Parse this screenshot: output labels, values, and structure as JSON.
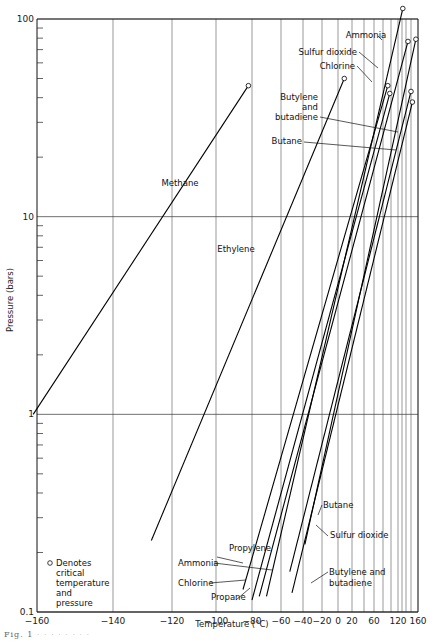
{
  "chart_data": {
    "type": "line",
    "title": "",
    "xlabel": "Temperature (°C)",
    "ylabel": "Pressure (bars)",
    "yscale": "log",
    "ylim": [
      0.1,
      100
    ],
    "xlim": [
      -160,
      160
    ],
    "grid": true,
    "x_ticks": [
      -160,
      -140,
      -120,
      -100,
      -80,
      -60,
      -40,
      -20,
      0,
      20,
      60,
      120,
      160
    ],
    "x_tick_labels": [
      "−160",
      "−140",
      "−120",
      "−100",
      "−80",
      "−60",
      "−40",
      "−20",
      "0",
      "20",
      "60",
      "120",
      "160"
    ],
    "x_gridlines": [
      -140,
      -120,
      -100,
      -80,
      -60,
      -40,
      -20,
      0,
      20,
      40,
      60,
      80,
      100,
      120,
      130,
      140,
      150,
      160
    ],
    "y_major_ticks": [
      0.1,
      1,
      10,
      100
    ],
    "y_tick_labels": [
      "0.1",
      "1",
      "10",
      "100"
    ],
    "legend": {
      "symbol": "o",
      "text": [
        "Denotes",
        "critical",
        "temperature",
        "and",
        "pressure"
      ],
      "placement": "bottom-left"
    },
    "series": [
      {
        "name": "Methane",
        "points": [
          [
            -161,
            1.0
          ],
          [
            -82,
            46
          ]
        ],
        "critical_point": [
          -82,
          46
        ]
      },
      {
        "name": "Ethylene",
        "points": [
          [
            -127,
            0.23
          ],
          [
            9,
            50
          ]
        ],
        "critical_point": [
          9,
          50
        ]
      },
      {
        "name": "Propylene",
        "points": [
          [
            -85,
            0.13
          ],
          [
            92,
            46
          ]
        ],
        "critical_point": [
          92,
          46
        ]
      },
      {
        "name": "Ammonia",
        "points": [
          [
            -70,
            0.12
          ],
          [
            132,
            113
          ]
        ],
        "critical_point": [
          132,
          113
        ]
      },
      {
        "name": "Chlorine",
        "points": [
          [
            -75,
            0.12
          ],
          [
            144,
            77
          ]
        ],
        "critical_point": [
          144,
          77
        ]
      },
      {
        "name": "Propane",
        "points": [
          [
            -80,
            0.115
          ],
          [
            97,
            42
          ]
        ],
        "critical_point": [
          97,
          42
        ]
      },
      {
        "name": "Sulfur dioxide",
        "points": [
          [
            -38,
            0.22
          ],
          [
            157,
            79
          ]
        ],
        "critical_point": [
          157,
          79
        ]
      },
      {
        "name": "Butane",
        "points": [
          [
            -50,
            0.125
          ],
          [
            152,
            38
          ]
        ],
        "critical_point": [
          152,
          38
        ]
      },
      {
        "name": "Butylene and butadiene",
        "points": [
          [
            -52,
            0.16
          ],
          [
            150,
            43
          ]
        ],
        "critical_point": [
          150,
          43
        ]
      }
    ],
    "annotations": [
      {
        "text": "Methane",
        "target": "Methane"
      },
      {
        "text": "Ethylene",
        "target": "Ethylene"
      },
      {
        "text": "Ammonia",
        "target": "Ammonia",
        "position": "top"
      },
      {
        "text": "Sulfur dioxide",
        "target": "Sulfur dioxide",
        "position": "top"
      },
      {
        "text": "Chlorine",
        "target": "Chlorine",
        "position": "top"
      },
      {
        "text": "Butylene and butadiene",
        "target": "Butylene and butadiene",
        "position": "top"
      },
      {
        "text": "Butane",
        "target": "Butane",
        "position": "top"
      },
      {
        "text": "Propylene",
        "target": "Propylene",
        "position": "bottom"
      },
      {
        "text": "Ammonia",
        "target": "Ammonia",
        "position": "bottom"
      },
      {
        "text": "Chlorine",
        "target": "Chlorine",
        "position": "bottom"
      },
      {
        "text": "Propane",
        "target": "Propane",
        "position": "bottom"
      },
      {
        "text": "Butane",
        "target": "Butane",
        "position": "bottom"
      },
      {
        "text": "Sulfur dioxide",
        "target": "Sulfur dioxide",
        "position": "bottom"
      },
      {
        "text": "Butylene and butadiene",
        "target": "Butylene and butadiene",
        "position": "bottom"
      }
    ]
  },
  "labels": {
    "methane": "Methane",
    "ethylene": "Ethylene",
    "ammonia_top": "Ammonia",
    "so2_top": "Sulfur dioxide",
    "chlorine_top": "Chlorine",
    "butylene_top_1": "Butylene",
    "butylene_top_2": "and",
    "butylene_top_3": "butadiene",
    "butane_top": "Butane",
    "propylene_bot": "Propylene",
    "ammonia_bot": "Ammonia",
    "chlorine_bot": "Chlorine",
    "propane_bot": "Propane",
    "butane_bot": "Butane",
    "so2_bot": "Sulfur dioxide",
    "butylene_bot_1": "Butylene and",
    "butylene_bot_2": "butadiene"
  },
  "caption": "Fig. 1"
}
